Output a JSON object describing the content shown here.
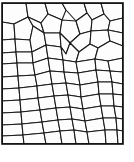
{
  "figure": {
    "kind": "polygonal-tessellation-diagram",
    "title": "",
    "caption": "",
    "labels": [],
    "axis_labels": [],
    "legend": [],
    "colors": {
      "background": "#ffffff",
      "cell_fill": "#fdfdfd",
      "cell_stroke": "#1a1a1a",
      "frame_stroke": "#111111"
    },
    "geometry": {
      "canvas_width": 134,
      "canvas_height": 162,
      "frame": {
        "x": 2,
        "y": 3,
        "width": 121,
        "height": 141
      },
      "stroke_width": 1.1,
      "frame_stroke_width": 1.6,
      "cell_count": 96
    },
    "cells": [
      {
        "id": "c01",
        "points": "2,3 26,3 28,17 14,24 2,22"
      },
      {
        "id": "c02",
        "points": "26,3 45,3 48,14 41,23 28,17"
      },
      {
        "id": "c03",
        "points": "45,3 62,3 66,10 62,20 48,14"
      },
      {
        "id": "c04",
        "points": "62,3 84,3 87,13 76,21 66,10"
      },
      {
        "id": "c05",
        "points": "84,3 101,3 104,14 92,20 87,13"
      },
      {
        "id": "c06",
        "points": "101,3 123,3 123,18 110,21 104,14"
      },
      {
        "id": "c07",
        "points": "2,22 14,24 15,39 2,40"
      },
      {
        "id": "c08",
        "points": "14,24 28,17 33,26 30,40 15,39"
      },
      {
        "id": "c09",
        "points": "28,17 41,23 44,33 33,26"
      },
      {
        "id": "c10",
        "points": "41,23 48,14 62,20 60,33 44,33"
      },
      {
        "id": "c11",
        "points": "62,20 76,21 80,34 70,43 60,33"
      },
      {
        "id": "c12",
        "points": "76,21 87,13 92,20 91,31 80,34"
      },
      {
        "id": "c13",
        "points": "92,20 104,14 110,21 108,30 91,31"
      },
      {
        "id": "c14",
        "points": "110,21 123,18 123,33 108,30"
      },
      {
        "id": "c15",
        "points": "2,40 15,39 16,52 2,53"
      },
      {
        "id": "c16",
        "points": "15,39 30,40 32,52 16,52"
      },
      {
        "id": "c17",
        "points": "30,40 33,26 44,33 46,45 32,52"
      },
      {
        "id": "c18",
        "points": "44,33 60,33 61,47 46,45"
      },
      {
        "id": "c19",
        "points": "60,33 70,43 66,54 61,47"
      },
      {
        "id": "c20",
        "points": "70,43 80,34 91,31 90,44 79,52"
      },
      {
        "id": "c21",
        "points": "91,31 108,30 110,41 98,48 90,44"
      },
      {
        "id": "c22",
        "points": "108,30 123,33 123,46 110,41"
      },
      {
        "id": "c23",
        "points": "2,53 16,52 17,63 2,64"
      },
      {
        "id": "c24",
        "points": "16,52 32,52 33,63 17,63"
      },
      {
        "id": "c25",
        "points": "32,52 46,45 48,58 33,63"
      },
      {
        "id": "c26",
        "points": "46,45 61,47 63,60 48,58"
      },
      {
        "id": "c27",
        "points": "61,47 66,54 70,43 79,52 76,62 63,60"
      },
      {
        "id": "c28",
        "points": "79,52 90,44 98,48 95,59 76,62"
      },
      {
        "id": "c29",
        "points": "98,48 110,41 123,46 123,58 108,61 95,59"
      },
      {
        "id": "c30",
        "points": "2,64 17,63 18,76 2,77"
      },
      {
        "id": "c31",
        "points": "17,63 33,63 35,75 18,76"
      },
      {
        "id": "c32",
        "points": "33,63 48,58 50,71 35,75"
      },
      {
        "id": "c33",
        "points": "48,58 63,60 64,72 50,71"
      },
      {
        "id": "c34",
        "points": "63,60 76,62 78,73 64,72"
      },
      {
        "id": "c35",
        "points": "76,62 95,59 96,70 78,73"
      },
      {
        "id": "c36",
        "points": "95,59 108,61 110,71 96,70"
      },
      {
        "id": "c37",
        "points": "108,61 123,58 123,72 110,71"
      },
      {
        "id": "c38",
        "points": "2,77 18,76 19,88 2,89"
      },
      {
        "id": "c39",
        "points": "18,76 35,75 37,86 19,88"
      },
      {
        "id": "c40",
        "points": "35,75 50,71 52,84 37,86"
      },
      {
        "id": "c41",
        "points": "50,71 64,72 66,83 52,84"
      },
      {
        "id": "c42",
        "points": "64,72 78,73 80,85 66,83"
      },
      {
        "id": "c43",
        "points": "78,73 96,70 98,82 80,85"
      },
      {
        "id": "c44",
        "points": "96,70 110,71 112,82 98,82"
      },
      {
        "id": "c45",
        "points": "110,71 123,72 123,84 112,82"
      },
      {
        "id": "c46",
        "points": "2,89 19,88 20,100 2,101"
      },
      {
        "id": "c47",
        "points": "19,88 37,86 38,98 20,100"
      },
      {
        "id": "c48",
        "points": "37,86 52,84 54,96 38,98"
      },
      {
        "id": "c49",
        "points": "52,84 66,83 68,95 54,96"
      },
      {
        "id": "c50",
        "points": "66,83 80,85 81,97 68,95"
      },
      {
        "id": "c51",
        "points": "80,85 98,82 99,94 81,97"
      },
      {
        "id": "c52",
        "points": "98,82 112,82 113,94 99,94"
      },
      {
        "id": "c53",
        "points": "112,82 123,84 123,95 113,94"
      },
      {
        "id": "c54",
        "points": "2,101 20,100 21,112 2,113"
      },
      {
        "id": "c55",
        "points": "20,100 38,98 40,110 21,112"
      },
      {
        "id": "c56",
        "points": "38,98 54,96 56,108 40,110"
      },
      {
        "id": "c57",
        "points": "54,96 68,95 70,107 56,108"
      },
      {
        "id": "c58",
        "points": "68,95 81,97 83,109 70,107"
      },
      {
        "id": "c59",
        "points": "81,97 99,94 101,106 83,109"
      },
      {
        "id": "c60",
        "points": "99,94 113,94 114,106 101,106"
      },
      {
        "id": "c61",
        "points": "113,94 123,95 123,107 114,106"
      },
      {
        "id": "c62",
        "points": "2,113 21,112 22,124 2,125"
      },
      {
        "id": "c63",
        "points": "21,112 40,110 42,122 22,124"
      },
      {
        "id": "c64",
        "points": "40,110 56,108 58,120 42,122"
      },
      {
        "id": "c65",
        "points": "56,108 70,107 72,119 58,120"
      },
      {
        "id": "c66",
        "points": "70,107 83,109 85,121 72,119"
      },
      {
        "id": "c67",
        "points": "83,109 101,106 103,118 85,121"
      },
      {
        "id": "c68",
        "points": "101,106 114,106 116,118 103,118"
      },
      {
        "id": "c69",
        "points": "114,106 123,107 123,119 116,118"
      },
      {
        "id": "c70",
        "points": "2,125 22,124 23,135 2,136"
      },
      {
        "id": "c71",
        "points": "22,124 42,122 44,133 23,135"
      },
      {
        "id": "c72",
        "points": "42,122 58,120 60,131 44,133"
      },
      {
        "id": "c73",
        "points": "58,120 72,119 74,130 60,131"
      },
      {
        "id": "c74",
        "points": "72,119 85,121 87,132 74,130"
      },
      {
        "id": "c75",
        "points": "85,121 103,118 105,130 87,132"
      },
      {
        "id": "c76",
        "points": "103,118 116,118 117,130 105,130"
      },
      {
        "id": "c77",
        "points": "116,118 123,119 123,131 117,130"
      },
      {
        "id": "c78",
        "points": "2,136 23,135 24,144 2,144"
      },
      {
        "id": "c79",
        "points": "23,135 44,133 46,144 24,144"
      },
      {
        "id": "c80",
        "points": "44,133 60,131 62,144 46,144"
      },
      {
        "id": "c81",
        "points": "60,131 74,130 76,144 62,144"
      },
      {
        "id": "c82",
        "points": "74,130 87,132 89,144 76,144"
      },
      {
        "id": "c83",
        "points": "87,132 105,130 106,144 89,144"
      },
      {
        "id": "c84",
        "points": "105,130 117,130 118,144 106,144"
      },
      {
        "id": "c85",
        "points": "117,130 123,131 123,144 118,144"
      }
    ],
    "extra_edges": [
      "M2,3 L123,3",
      "M2,144 L123,144",
      "M2,3 L2,144",
      "M123,3 L123,144"
    ]
  }
}
